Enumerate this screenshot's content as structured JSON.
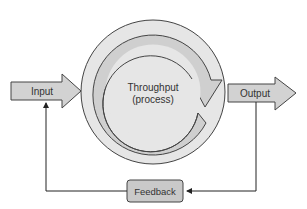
{
  "diagram": {
    "type": "systems-feedback-loop",
    "nodes": {
      "input": {
        "label": "Input"
      },
      "process": {
        "label_line1": "Throughput",
        "label_line2": "(process)"
      },
      "output": {
        "label": "Output"
      },
      "feedback": {
        "label": "Feedback"
      }
    },
    "edges": [
      {
        "from": "input",
        "to": "process"
      },
      {
        "from": "process",
        "to": "output"
      },
      {
        "from": "output",
        "to": "feedback"
      },
      {
        "from": "feedback",
        "to": "input"
      }
    ],
    "colors": {
      "arrow_fill": "#d2d2d2",
      "circle_fill": "#e6e6e6",
      "ring_fill": "#cfcfcf",
      "stroke": "#444444",
      "feedback_fill": "#c9c9c9"
    }
  }
}
